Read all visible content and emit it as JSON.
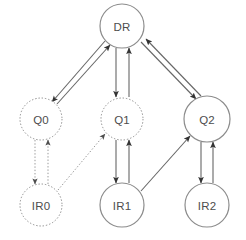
{
  "diagram": {
    "type": "directed-graph",
    "canvas": {
      "width": 246,
      "height": 240,
      "background": "#ffffff"
    },
    "colors": {
      "node_stroke": "#8c8c8c",
      "node_fill": "#ffffff",
      "node_label": "#4d4d4d",
      "edge_solid": "#666666",
      "edge_dotted": "#999999",
      "arrowhead": "#333333"
    },
    "nodes": [
      {
        "id": "DR",
        "label": "DR",
        "cx": 122,
        "cy": 26,
        "r": 22,
        "style": "solid"
      },
      {
        "id": "Q0",
        "label": "Q0",
        "cx": 41,
        "cy": 119,
        "r": 21,
        "style": "dotted"
      },
      {
        "id": "Q1",
        "label": "Q1",
        "cx": 122,
        "cy": 119,
        "r": 21,
        "style": "dotted"
      },
      {
        "id": "Q2",
        "label": "Q2",
        "cx": 207,
        "cy": 119,
        "r": 23,
        "style": "solid"
      },
      {
        "id": "IR0",
        "label": "IR0",
        "cx": 41,
        "cy": 205,
        "r": 21,
        "style": "dotted"
      },
      {
        "id": "IR1",
        "label": "IR1",
        "cx": 122,
        "cy": 205,
        "r": 22,
        "style": "solid"
      },
      {
        "id": "IR2",
        "label": "IR2",
        "cx": 207,
        "cy": 205,
        "r": 22,
        "style": "solid"
      }
    ],
    "edges": [
      {
        "id": "dr-to-q0",
        "from": "DR",
        "to": "Q0",
        "style": "solid",
        "x1": 105,
        "y1": 41,
        "x2": 52,
        "y2": 102
      },
      {
        "id": "q0-to-dr",
        "from": "Q0",
        "to": "DR",
        "style": "solid",
        "x1": 57,
        "y1": 104,
        "x2": 110,
        "y2": 45
      },
      {
        "id": "dr-to-q1",
        "from": "DR",
        "to": "Q1",
        "style": "solid",
        "x1": 116,
        "y1": 48,
        "x2": 116,
        "y2": 97
      },
      {
        "id": "q1-to-dr",
        "from": "Q1",
        "to": "DR",
        "style": "solid",
        "x1": 129,
        "y1": 97,
        "x2": 129,
        "y2": 48
      },
      {
        "id": "dr-to-q2",
        "from": "DR",
        "to": "Q2",
        "style": "solid",
        "x1": 141,
        "y1": 42,
        "x2": 196,
        "y2": 99
      },
      {
        "id": "q2-to-dr",
        "from": "Q2",
        "to": "DR",
        "style": "solid",
        "x1": 201,
        "y1": 96,
        "x2": 146,
        "y2": 39
      },
      {
        "id": "q0-to-ir0",
        "from": "Q0",
        "to": "IR0",
        "style": "dotted",
        "x1": 35,
        "y1": 140,
        "x2": 35,
        "y2": 184
      },
      {
        "id": "ir0-to-q0",
        "from": "IR0",
        "to": "Q0",
        "style": "dotted",
        "x1": 48,
        "y1": 184,
        "x2": 48,
        "y2": 140
      },
      {
        "id": "ir0-to-q1",
        "from": "IR0",
        "to": "Q1",
        "style": "dotted",
        "x1": 58,
        "y1": 190,
        "x2": 105,
        "y2": 134
      },
      {
        "id": "q1-to-ir1",
        "from": "Q1",
        "to": "IR1",
        "style": "solid",
        "x1": 116,
        "y1": 140,
        "x2": 116,
        "y2": 183
      },
      {
        "id": "ir1-to-q1",
        "from": "IR1",
        "to": "Q1",
        "style": "solid",
        "x1": 129,
        "y1": 183,
        "x2": 129,
        "y2": 140
      },
      {
        "id": "ir1-to-q2",
        "from": "IR1",
        "to": "Q2",
        "style": "solid",
        "x1": 141,
        "y1": 191,
        "x2": 190,
        "y2": 136
      },
      {
        "id": "q2-to-ir2",
        "from": "Q2",
        "to": "IR2",
        "style": "solid",
        "x1": 201,
        "y1": 142,
        "x2": 201,
        "y2": 183
      },
      {
        "id": "ir2-to-q2",
        "from": "IR2",
        "to": "Q2",
        "style": "solid",
        "x1": 213,
        "y1": 183,
        "x2": 213,
        "y2": 142
      }
    ]
  }
}
